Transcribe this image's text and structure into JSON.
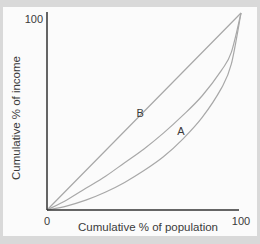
{
  "chart_data": {
    "type": "line",
    "title": "",
    "xlabel": "Cumulative % of population",
    "ylabel": "Cumulative % of income",
    "xlim": [
      0,
      100
    ],
    "ylim": [
      0,
      100
    ],
    "x_ticks": [
      "0",
      "100"
    ],
    "y_ticks": [
      "100"
    ],
    "grid": false,
    "legend": "none",
    "series": [
      {
        "name": "Line of equality",
        "x": [
          0,
          100
        ],
        "y": [
          0,
          100
        ],
        "color": "#a8a8a8"
      },
      {
        "name": "Lorenz curve B",
        "x": [
          0,
          10,
          20,
          30,
          40,
          50,
          60,
          70,
          80,
          90,
          95,
          100
        ],
        "y": [
          0,
          5,
          11,
          17,
          24,
          31,
          39,
          48,
          58,
          71,
          80,
          100
        ],
        "color": "#a8a8a8"
      },
      {
        "name": "Lorenz curve A",
        "x": [
          0,
          10,
          20,
          30,
          40,
          50,
          60,
          70,
          80,
          90,
          95,
          100
        ],
        "y": [
          0,
          2,
          5,
          9,
          14,
          20,
          27,
          36,
          47,
          62,
          74,
          100
        ],
        "color": "#a8a8a8"
      }
    ],
    "annotations": [
      {
        "text": "B",
        "x": 48,
        "y": 49
      },
      {
        "text": "A",
        "x": 69,
        "y": 40
      }
    ]
  }
}
